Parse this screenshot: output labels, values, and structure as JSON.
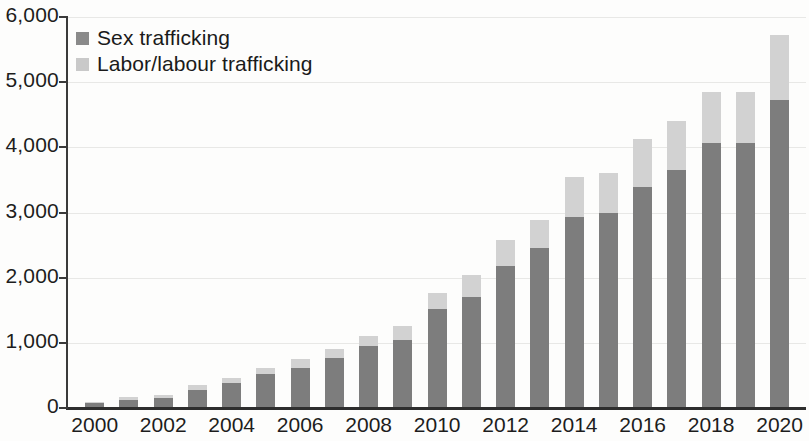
{
  "chart_data": {
    "type": "bar",
    "stacked": true,
    "title": "",
    "subtitle": "",
    "xlabel": "",
    "ylabel": "",
    "ylim": [
      0,
      6000
    ],
    "ytick_values": [
      0,
      1000,
      2000,
      3000,
      4000,
      5000,
      6000
    ],
    "ytick_labels": [
      "0",
      "1,000",
      "2,000",
      "3,000",
      "4,000",
      "5,000",
      "6,000"
    ],
    "grid": true,
    "grid_axis": "y",
    "legend_position": "top-left",
    "categories": [
      "2000",
      "2001",
      "2002",
      "2003",
      "2004",
      "2005",
      "2006",
      "2007",
      "2008",
      "2009",
      "2010",
      "2011",
      "2012",
      "2013",
      "2014",
      "2015",
      "2016",
      "2017",
      "2018",
      "2019",
      "2020"
    ],
    "xtick_labels": [
      "2000",
      "2002",
      "2004",
      "2006",
      "2008",
      "2010",
      "2012",
      "2014",
      "2016",
      "2018",
      "2020"
    ],
    "series": [
      {
        "name": "Sex trafficking",
        "color": "#7d7d7d",
        "values": [
          70,
          130,
          160,
          280,
          380,
          520,
          620,
          760,
          950,
          1040,
          1520,
          1700,
          2180,
          2450,
          2930,
          2990,
          3390,
          3660,
          4070,
          4060,
          4720
        ]
      },
      {
        "name": "Labor/labour trafficking",
        "color": "#d2d2d2",
        "values": [
          20,
          40,
          40,
          70,
          80,
          90,
          140,
          150,
          150,
          220,
          240,
          340,
          400,
          440,
          610,
          620,
          740,
          740,
          780,
          790,
          1010
        ]
      }
    ],
    "totals": [
      90,
      170,
      200,
      350,
      460,
      610,
      760,
      910,
      1100,
      1260,
      1760,
      2040,
      2580,
      2890,
      3540,
      3610,
      4130,
      4400,
      4850,
      4850,
      5730
    ]
  },
  "legend": {
    "items": [
      {
        "label": "Sex trafficking",
        "swatch": "dark-gray-swatch"
      },
      {
        "label": "Labor/labour trafficking",
        "swatch": "light-gray-swatch"
      }
    ]
  }
}
